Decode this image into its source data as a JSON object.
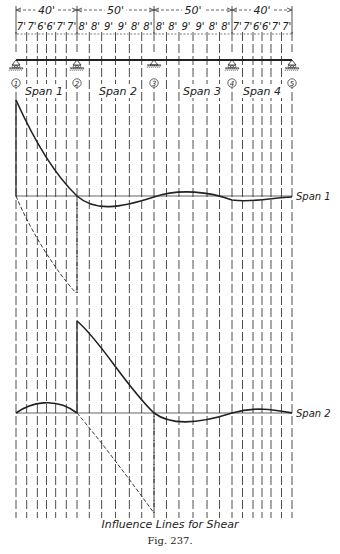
{
  "figure": {
    "title": "Influence Lines for Shear",
    "caption": "Fig. 237.",
    "ink_color": "#222222",
    "background": "#ffffff"
  },
  "spans": [
    {
      "label": "Span 1",
      "length": "40'",
      "panels": [
        "7'",
        "7'",
        "6'",
        "6'",
        "7'",
        "7'"
      ]
    },
    {
      "label": "Span 2",
      "length": "50'",
      "panels": [
        "8'",
        "8'",
        "9'",
        "9'",
        "8'",
        "8'"
      ]
    },
    {
      "label": "Span 3",
      "length": "50'",
      "panels": [
        "8'",
        "8'",
        "9'",
        "9'",
        "8'",
        "8'"
      ]
    },
    {
      "label": "Span 4",
      "length": "40'",
      "panels": [
        "7'",
        "7'",
        "6'",
        "6'",
        "7'",
        "7'"
      ]
    }
  ],
  "supports": [
    {
      "id": "1",
      "type": "roller"
    },
    {
      "id": "2",
      "type": "roller"
    },
    {
      "id": "3",
      "type": "hinge"
    },
    {
      "id": "4",
      "type": "roller"
    },
    {
      "id": "5",
      "type": "roller"
    }
  ],
  "influence_lines": [
    {
      "label": "Span 1"
    },
    {
      "label": "Span 2"
    }
  ]
}
